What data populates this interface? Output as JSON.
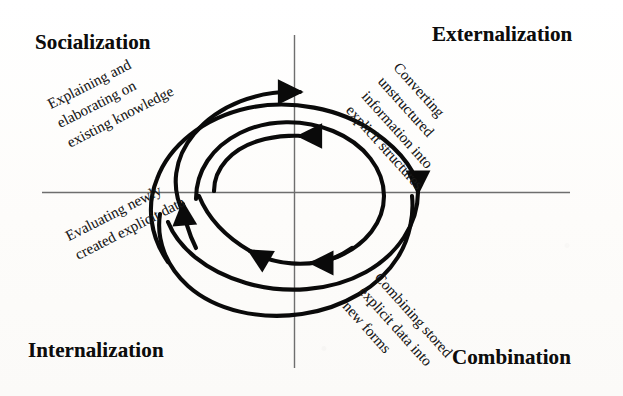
{
  "figure": {
    "kind": "seci-knowledge-spiral",
    "background_color": "#fdfdfc",
    "ink_color": "#111111",
    "axis_color": "#6e6e6e",
    "spiral_color": "#0a0a0a"
  },
  "axes": {
    "horizontal_label": "",
    "vertical_label": "",
    "horizontal": {
      "x1": 42,
      "x2": 570,
      "y": 192
    },
    "vertical": {
      "x": 294,
      "y1": 35,
      "y2": 368
    }
  },
  "quadrants": [
    {
      "id": "socialization",
      "title": "Socialization",
      "position": "top-left",
      "caption_lines": [
        "Explaining and",
        "elaborating on",
        "existing knowledge"
      ],
      "caption_rotation_deg": -27
    },
    {
      "id": "externalization",
      "title": "Externalization",
      "position": "top-right",
      "caption_lines": [
        "Converting",
        "unstructured",
        "information into",
        "explicit structures"
      ],
      "caption_rotation_deg": 48
    },
    {
      "id": "internalization",
      "title": "Internalization",
      "position": "bottom-left",
      "caption_lines": [
        "Evaluating newly",
        "created explicit data"
      ],
      "caption_rotation_deg": -27
    },
    {
      "id": "combination",
      "title": "Combination",
      "position": "bottom-right",
      "caption_lines": [
        "Combining stored",
        "explicit data into",
        "new forms"
      ],
      "caption_rotation_deg": 48
    }
  ],
  "spiral": {
    "description": "Three-turn clockwise spiral crossing all four quadrants",
    "turns": 3,
    "direction": "clockwise",
    "stroke_width": 4,
    "center": {
      "x": 294,
      "y": 192
    },
    "arrowheads": [
      {
        "id": "arrow-top-outer",
        "direction": "right",
        "x": 300,
        "y": 108
      },
      {
        "id": "arrow-top-inner",
        "direction": "right",
        "x": 300,
        "y": 133
      },
      {
        "id": "arrow-right",
        "direction": "down",
        "x": 410,
        "y": 190
      },
      {
        "id": "arrow-bottom",
        "direction": "left",
        "x": 305,
        "y": 262
      },
      {
        "id": "arrow-left",
        "direction": "up",
        "x": 183,
        "y": 200
      }
    ]
  }
}
